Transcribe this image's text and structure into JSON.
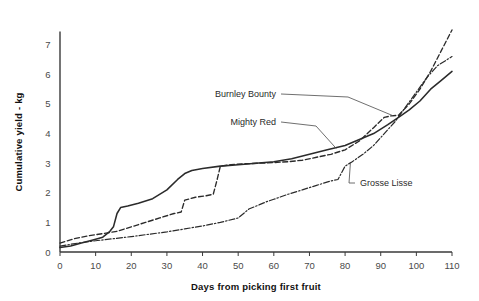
{
  "chart_data": {
    "type": "line",
    "title": "",
    "xlabel": "Days from picking first fruit",
    "ylabel": "Cumulative yield - kg",
    "xlim": [
      0,
      110
    ],
    "ylim": [
      0,
      7.6
    ],
    "xticks": [
      "0",
      "10",
      "20",
      "30",
      "40",
      "50",
      "60",
      "70",
      "80",
      "90",
      "100",
      "110"
    ],
    "yticks": [
      "0",
      "1",
      "2",
      "3",
      "4",
      "5",
      "6",
      "7"
    ],
    "grid": false,
    "legend_position": "inline-annotations",
    "series": [
      {
        "name": "Mighty Red",
        "line_style": "solid",
        "color": "#2b2b2b",
        "label_x": 276,
        "label_y": 125,
        "x": [
          0,
          3,
          6,
          9,
          12,
          14,
          15,
          16,
          17,
          19,
          22,
          26,
          30,
          33,
          35,
          37,
          40,
          45,
          50,
          55,
          60,
          65,
          70,
          75,
          80,
          84,
          88,
          92,
          95,
          98,
          101,
          104,
          107,
          110
        ],
        "y": [
          0.15,
          0.2,
          0.3,
          0.4,
          0.5,
          0.7,
          0.85,
          1.3,
          1.5,
          1.55,
          1.65,
          1.8,
          2.1,
          2.45,
          2.65,
          2.75,
          2.82,
          2.9,
          2.95,
          3.0,
          3.05,
          3.15,
          3.3,
          3.45,
          3.6,
          3.8,
          4.0,
          4.3,
          4.55,
          4.8,
          5.1,
          5.5,
          5.8,
          6.1
        ]
      },
      {
        "name": "Burnley Bounty",
        "line_style": "dashed",
        "color": "#2b2b2b",
        "label_x": 276,
        "label_y": 97,
        "x": [
          0,
          4,
          8,
          12,
          16,
          20,
          24,
          28,
          32,
          34,
          35,
          38,
          41,
          43,
          44,
          45,
          48,
          52,
          56,
          60,
          64,
          68,
          72,
          76,
          80,
          84,
          88,
          91,
          93,
          95,
          98,
          101,
          104,
          107,
          110
        ],
        "y": [
          0.3,
          0.45,
          0.55,
          0.62,
          0.7,
          0.85,
          1.0,
          1.15,
          1.3,
          1.35,
          1.75,
          1.85,
          1.9,
          1.95,
          2.4,
          2.9,
          2.95,
          2.98,
          3.0,
          3.02,
          3.05,
          3.1,
          3.2,
          3.3,
          3.45,
          3.75,
          4.2,
          4.55,
          4.6,
          4.62,
          5.0,
          5.5,
          6.1,
          6.8,
          7.5
        ]
      },
      {
        "name": "Grosse Lisse",
        "line_style": "dashdot",
        "color": "#2b2b2b",
        "label_x": 360,
        "label_y": 186,
        "x": [
          0,
          5,
          10,
          15,
          20,
          25,
          30,
          35,
          40,
          45,
          50,
          53,
          56,
          58,
          60,
          64,
          68,
          72,
          76,
          78,
          80,
          82,
          85,
          88,
          91,
          94,
          97,
          100,
          103,
          106,
          110
        ],
        "y": [
          0.2,
          0.3,
          0.38,
          0.45,
          0.52,
          0.6,
          0.68,
          0.78,
          0.88,
          1.0,
          1.15,
          1.45,
          1.6,
          1.7,
          1.78,
          1.95,
          2.1,
          2.25,
          2.4,
          2.45,
          2.9,
          3.05,
          3.3,
          3.6,
          4.0,
          4.4,
          4.9,
          5.4,
          5.9,
          6.3,
          6.6
        ]
      }
    ]
  },
  "annotations": {
    "burnley_label": "Burnley Bounty",
    "mighty_label": "Mighty Red",
    "grosse_label": "Grosse Lisse"
  }
}
